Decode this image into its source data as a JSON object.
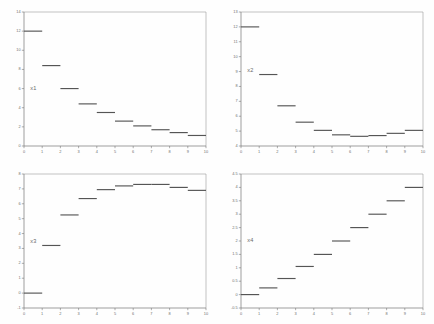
{
  "figure": {
    "title": "",
    "background_color": "#fefefe",
    "layout": "2x2 grid of step plots",
    "panel_count": 4
  },
  "chart_data": [
    {
      "type": "line",
      "subtype": "step",
      "title": "",
      "label": "x1",
      "panel": "top-left",
      "xlabel": "",
      "ylabel": "",
      "xlim": [
        0,
        10
      ],
      "ylim": [
        0,
        14
      ],
      "grid": false,
      "legend": "inline-label",
      "xticks": [
        0,
        1,
        2,
        3,
        4,
        5,
        6,
        7,
        8,
        9,
        10
      ],
      "yticks": [
        0,
        2,
        4,
        6,
        8,
        10,
        12,
        14
      ],
      "xticklabels": [
        "0",
        "1",
        "2",
        "3",
        "4",
        "5",
        "6",
        "7",
        "8",
        "9",
        "10"
      ],
      "yticklabels": [
        "0",
        "2",
        "4",
        "6",
        "8",
        "10",
        "12",
        "14"
      ],
      "x": [
        0,
        1,
        2,
        3,
        4,
        5,
        6,
        7,
        8,
        9
      ],
      "values": [
        12.0,
        8.4,
        6.0,
        4.4,
        3.5,
        2.6,
        2.1,
        1.7,
        1.4,
        1.1
      ],
      "label_position": {
        "x": 0.35,
        "y": 6.0
      }
    },
    {
      "type": "line",
      "subtype": "step",
      "title": "",
      "label": "x2",
      "panel": "top-right",
      "xlabel": "",
      "ylabel": "",
      "xlim": [
        0,
        10
      ],
      "ylim": [
        4,
        13
      ],
      "grid": false,
      "legend": "inline-label",
      "xticks": [
        0,
        1,
        2,
        3,
        4,
        5,
        6,
        7,
        8,
        9,
        10
      ],
      "yticks": [
        4,
        5,
        6,
        7,
        8,
        9,
        10,
        11,
        12,
        13
      ],
      "xticklabels": [
        "0",
        "1",
        "2",
        "3",
        "4",
        "5",
        "6",
        "7",
        "8",
        "9",
        "10"
      ],
      "yticklabels": [
        "4",
        "5",
        "6",
        "7",
        "8",
        "9",
        "10",
        "11",
        "12",
        "13"
      ],
      "x": [
        0,
        1,
        2,
        3,
        4,
        5,
        6,
        7,
        8,
        9
      ],
      "values": [
        12.0,
        8.8,
        6.7,
        5.6,
        5.05,
        4.75,
        4.65,
        4.7,
        4.85,
        5.05
      ],
      "label_position": {
        "x": 0.35,
        "y": 9.1
      }
    },
    {
      "type": "line",
      "subtype": "step",
      "title": "",
      "label": "x3",
      "panel": "bottom-left",
      "xlabel": "",
      "ylabel": "",
      "xlim": [
        0,
        10
      ],
      "ylim": [
        -1,
        8
      ],
      "grid": false,
      "legend": "inline-label",
      "xticks": [
        0,
        1,
        2,
        3,
        4,
        5,
        6,
        7,
        8,
        9,
        10
      ],
      "yticks": [
        -1,
        0,
        1,
        2,
        3,
        4,
        5,
        6,
        7,
        8
      ],
      "xticklabels": [
        "0",
        "1",
        "2",
        "3",
        "4",
        "5",
        "6",
        "7",
        "8",
        "9",
        "10"
      ],
      "yticklabels": [
        "-1",
        "0",
        "1",
        "2",
        "3",
        "4",
        "5",
        "6",
        "7",
        "8"
      ],
      "x": [
        0,
        1,
        2,
        3,
        4,
        5,
        6,
        7,
        8,
        9
      ],
      "values": [
        0.0,
        3.2,
        5.25,
        6.35,
        6.95,
        7.2,
        7.3,
        7.3,
        7.1,
        6.9
      ],
      "label_position": {
        "x": 0.35,
        "y": 3.45
      }
    },
    {
      "type": "line",
      "subtype": "step",
      "title": "",
      "label": "x4",
      "panel": "bottom-right",
      "xlabel": "",
      "ylabel": "",
      "xlim": [
        0,
        10
      ],
      "ylim": [
        -0.5,
        4.5
      ],
      "grid": false,
      "legend": "inline-label",
      "xticks": [
        0,
        1,
        2,
        3,
        4,
        5,
        6,
        7,
        8,
        9,
        10
      ],
      "yticks": [
        -0.5,
        0,
        0.5,
        1,
        1.5,
        2,
        2.5,
        3,
        3.5,
        4,
        4.5
      ],
      "xticklabels": [
        "0",
        "1",
        "2",
        "3",
        "4",
        "5",
        "6",
        "7",
        "8",
        "9",
        "10"
      ],
      "yticklabels": [
        "-0.5",
        "0",
        "0.5",
        "1",
        "1.5",
        "2",
        "2.5",
        "3",
        "3.5",
        "4",
        "4.5"
      ],
      "x": [
        0,
        1,
        2,
        3,
        4,
        5,
        6,
        7,
        8,
        9
      ],
      "values": [
        0.0,
        0.25,
        0.6,
        1.05,
        1.5,
        2.0,
        2.5,
        3.0,
        3.5,
        4.0
      ],
      "label_position": {
        "x": 0.35,
        "y": 2.0
      }
    }
  ],
  "colors": {
    "series_line": "#555555",
    "axis": "#777777",
    "frame": "#9a9a9a",
    "tick_label": "#6d6d6d",
    "series_label": "#6a6a6a",
    "background": "#fefefe"
  }
}
